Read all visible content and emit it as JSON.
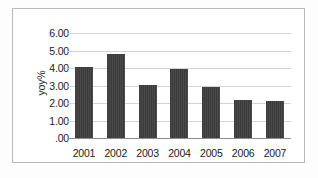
{
  "chart_data": {
    "type": "bar",
    "title": "",
    "xlabel": "",
    "ylabel": "yoy%",
    "categories": [
      "2001",
      "2002",
      "2003",
      "2004",
      "2005",
      "2006",
      "2007"
    ],
    "values": [
      4.05,
      4.8,
      3.05,
      3.97,
      2.93,
      2.2,
      2.12
    ],
    "ytick_labels": [
      "6.00",
      "5.00",
      "4.00",
      "3.00",
      "2.00",
      "1.00",
      ".00"
    ],
    "ytick_values": [
      6,
      5,
      4,
      3,
      2,
      1,
      0
    ],
    "ylim": [
      0,
      6
    ],
    "grid": true,
    "legend": "none",
    "bar_color": "#3a3a3a",
    "gridline_color": "#d4d4d4",
    "axis_color": "#8f8f8f",
    "frame_color": "#b9b9b9",
    "plot_background": "#ffffff"
  }
}
